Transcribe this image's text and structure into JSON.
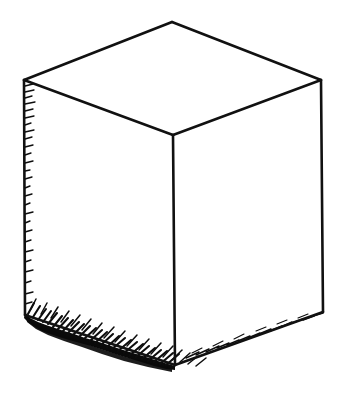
{
  "figure": {
    "style": "pen-and-ink line drawing",
    "background_color": "#ffffff",
    "ink_color": "#111111",
    "shadow_color": "#0a0a0a",
    "canvas": {
      "width": 357,
      "height": 403
    },
    "vertices": {
      "top_back": {
        "x": 172,
        "y": 22
      },
      "top_left": {
        "x": 24,
        "y": 80
      },
      "top_right": {
        "x": 321,
        "y": 80
      },
      "top_front": {
        "x": 173,
        "y": 135
      },
      "bottom_left": {
        "x": 25,
        "y": 315
      },
      "bottom_front": {
        "x": 175,
        "y": 365
      },
      "bottom_right": {
        "x": 323,
        "y": 312
      }
    },
    "faces": [
      {
        "name": "top-face",
        "fill": "#ffffff",
        "visible": true
      },
      {
        "name": "left-face",
        "fill": "#ffffff",
        "visible": true
      },
      {
        "name": "right-face",
        "fill": "#ffffff",
        "visible": true
      }
    ],
    "edges": [
      {
        "name": "top-back-left-edge",
        "shaded": false
      },
      {
        "name": "top-back-right-edge",
        "shaded": false
      },
      {
        "name": "top-front-left-edge",
        "shaded": false
      },
      {
        "name": "top-front-right-edge",
        "shaded": false
      },
      {
        "name": "left-vertical-edge",
        "shaded": true,
        "shading": "light-hatch"
      },
      {
        "name": "front-vertical-edge",
        "shaded": false
      },
      {
        "name": "right-vertical-edge",
        "shaded": false
      },
      {
        "name": "bottom-left-edge",
        "shaded": true,
        "shading": "heavy-hatch"
      },
      {
        "name": "bottom-right-edge",
        "shaded": true,
        "shading": "sketch-hatch"
      }
    ],
    "shading": {
      "left_edge_hatch_count": 26,
      "bottom_left_hatch_count": 46,
      "bottom_right_hatch_count": 20,
      "description": "Short hatch strokes cluster along the left vertical edge and pool into a dense dark band beneath the bottom-left edge, reading as a cast ground shadow."
    }
  }
}
